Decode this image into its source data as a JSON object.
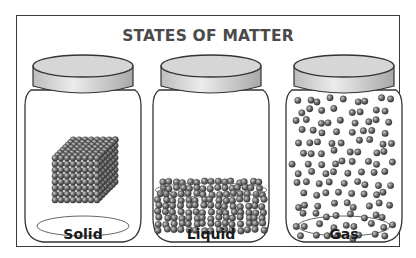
{
  "title": "STATES OF MATTER",
  "jars": [
    {
      "label": "Solid",
      "particles": "cube-lattice"
    },
    {
      "label": "Liquid",
      "particles": "loose-pile"
    },
    {
      "label": "Gas",
      "particles": "dispersed"
    }
  ],
  "colors": {
    "border": "#3a3a3a",
    "title": "#4a4a4a",
    "lid": "#d0d0d0",
    "particle": "#6e6e6e"
  }
}
